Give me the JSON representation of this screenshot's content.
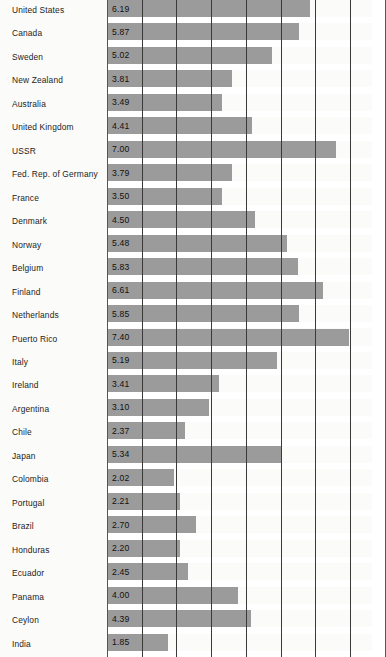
{
  "chart_data": {
    "type": "bar",
    "orientation": "horizontal",
    "title": "",
    "subtitle": "",
    "xlabel": "",
    "ylabel": "",
    "xlim": [
      0,
      8.1
    ],
    "grid": true,
    "gridlines_x": [
      0,
      1,
      2,
      3,
      4,
      5,
      6,
      7,
      8
    ],
    "legend": "none",
    "value_labels_inside_bars": true,
    "bar_color": "#9b9b9b",
    "background_color": "#fbfbfa",
    "gridline_color": "#3a3a3a",
    "categories": [
      "United States",
      "Canada",
      "Sweden",
      "New Zealand",
      "Australia",
      "United Kingdom",
      "USSR",
      "Fed. Rep. of Germany",
      "France",
      "Denmark",
      "Norway",
      "Belgium",
      "Finland",
      "Netherlands",
      "Puerto Rico",
      "Italy",
      "Ireland",
      "Argentina",
      "Chile",
      "Japan",
      "Colombia",
      "Portugal",
      "Brazil",
      "Honduras",
      "Ecuador",
      "Panama",
      "Ceylon",
      "India"
    ],
    "values": [
      6.19,
      5.87,
      5.02,
      3.81,
      3.49,
      4.41,
      7.0,
      3.79,
      3.5,
      4.5,
      5.48,
      5.83,
      6.61,
      5.85,
      7.4,
      5.19,
      3.41,
      3.1,
      2.37,
      5.34,
      2.02,
      2.21,
      2.7,
      2.2,
      2.45,
      4.0,
      4.39,
      1.85
    ],
    "value_labels": [
      "6.19",
      "5.87",
      "5.02",
      "3.81",
      "3.49",
      "4.41",
      "7.00",
      "3.79",
      "3.50",
      "4.50",
      "5.48",
      "5.83",
      "6.61",
      "5.85",
      "7.40",
      "5.19",
      "3.41",
      "3.10",
      "2.37",
      "5.34",
      "2.02",
      "2.21",
      "2.70",
      "2.20",
      "2.45",
      "4.00",
      "4.39",
      "1.85"
    ]
  }
}
